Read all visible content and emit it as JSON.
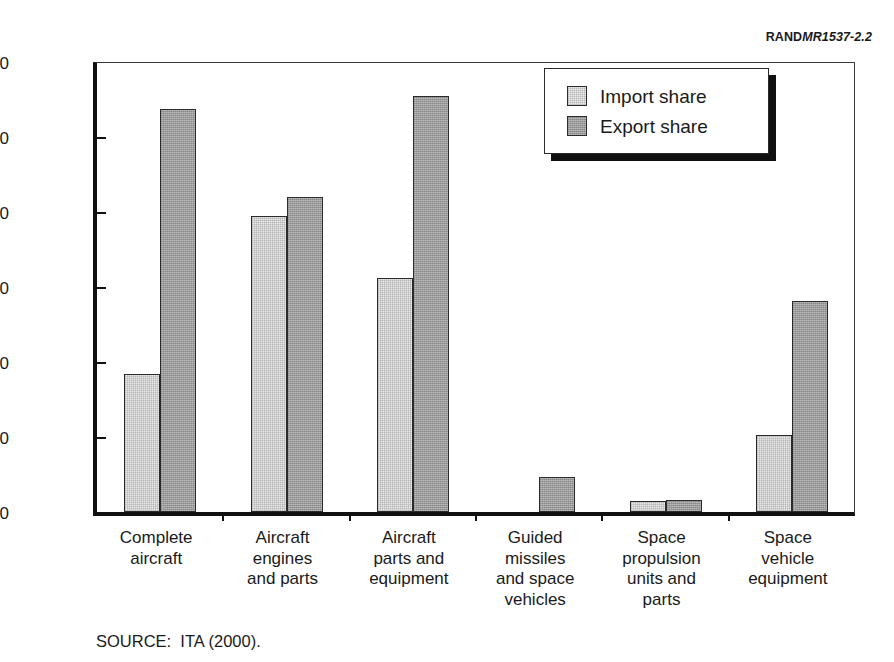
{
  "figure_id": {
    "brand": "RAND",
    "number": "MR1537-2.2"
  },
  "source_note": "SOURCE:  ITA (2000).",
  "legend": {
    "position": "top-right-inside",
    "items": [
      {
        "label": "Import share",
        "swatch": "light-gray",
        "color": "#ededed"
      },
      {
        "label": "Export share",
        "swatch": "dark-gray",
        "color": "#9c9c9c"
      }
    ]
  },
  "chart_data": {
    "type": "bar",
    "title": "",
    "xlabel": "",
    "ylabel": "Trade shares (%)",
    "ylim": [
      0,
      60
    ],
    "yticks": [
      0,
      10,
      20,
      30,
      40,
      50,
      60
    ],
    "grid": false,
    "categories": [
      "Complete\naircraft",
      "Aircraft\nengines\nand parts",
      "Aircraft\nparts and\nequipment",
      "Guided\nmissiles\nand space\nvehicles",
      "Space\npropulsion\nunits and\nparts",
      "Space\nvehicle\nequipment"
    ],
    "series": [
      {
        "name": "Import share",
        "color": "#ededed",
        "values": [
          18.4,
          39.5,
          31.2,
          0.0,
          1.5,
          10.3
        ]
      },
      {
        "name": "Export share",
        "color": "#9c9c9c",
        "values": [
          53.8,
          42.0,
          55.5,
          4.7,
          1.6,
          28.2
        ]
      }
    ]
  }
}
